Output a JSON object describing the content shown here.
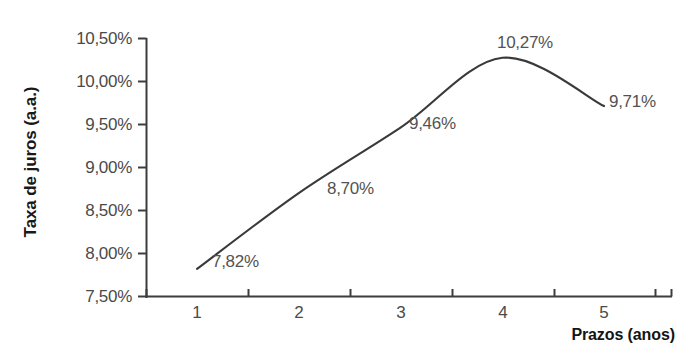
{
  "chart_data": {
    "type": "line",
    "title": "",
    "xlabel": "Prazos (anos)",
    "ylabel": "Taxa de juros (a.a.)",
    "categories": [
      "1",
      "2",
      "3",
      "4",
      "5"
    ],
    "x": [
      1,
      2,
      3,
      4,
      5
    ],
    "values": [
      7.82,
      8.7,
      9.46,
      10.27,
      9.71
    ],
    "point_labels": [
      "7,82%",
      "8,70%",
      "9,46%",
      "10,27%",
      "9,71%"
    ],
    "ylim": [
      7.5,
      10.5
    ],
    "ytick_values": [
      7.5,
      8.0,
      8.5,
      9.0,
      9.5,
      10.0,
      10.5
    ],
    "ytick_labels": [
      "7,50%",
      "8,00%",
      "8,50%",
      "9,00%",
      "9,50%",
      "10,00%",
      "10,50%"
    ],
    "xtick_labels": [
      "1",
      "2",
      "3",
      "4",
      "5"
    ],
    "grid": false,
    "legend": false,
    "legend_position": "none",
    "series_color": "#3a3a3a",
    "axis_color": "#3d3d3d",
    "label_color": "#4a4a4a",
    "smoothing": "spline"
  },
  "axes": {
    "y_title": "Taxa de juros (a.a.)",
    "x_title": "Prazos (anos)",
    "y_ticks": [
      {
        "label": "10,50%",
        "value": 10.5
      },
      {
        "label": "10,00%",
        "value": 10.0
      },
      {
        "label": "9,50%",
        "value": 9.5
      },
      {
        "label": "9,00%",
        "value": 9.0
      },
      {
        "label": "8,50%",
        "value": 8.5
      },
      {
        "label": "8,00%",
        "value": 8.0
      },
      {
        "label": "7,50%",
        "value": 7.5
      }
    ],
    "x_ticks": [
      {
        "label": "1",
        "value": 1
      },
      {
        "label": "2",
        "value": 2
      },
      {
        "label": "3",
        "value": 3
      },
      {
        "label": "4",
        "value": 4
      },
      {
        "label": "5",
        "value": 5
      }
    ]
  },
  "data_labels": [
    {
      "text": "7,82%",
      "value": 7.82
    },
    {
      "text": "8,70%",
      "value": 8.7
    },
    {
      "text": "9,46%",
      "value": 9.46
    },
    {
      "text": "10,27%",
      "value": 10.27
    },
    {
      "text": "9,71%",
      "value": 9.71
    }
  ],
  "cut_title": "a Estrutura a Termo da Taxa de Juros"
}
